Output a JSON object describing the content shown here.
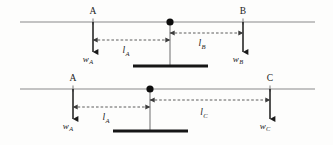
{
  "figure": {
    "name": "lever-moment-diagram",
    "background_color": "#fdfdfc",
    "line_color": "#8a8a8a",
    "arrow_color": "#1a1a1a",
    "dimension_color": "#4a4a4a",
    "support_color": "#161616"
  },
  "diagrams": [
    {
      "id": "top",
      "beam_y": 22,
      "beam_x1": 20,
      "beam_x2": 315,
      "pivot_x": 170,
      "support_bar": {
        "x1": 133,
        "x2": 208,
        "y": 66,
        "thickness": 3
      },
      "points": [
        {
          "id": "A",
          "label": "A",
          "x": 93,
          "label_y": 14,
          "force_label": "w",
          "force_sub": "A",
          "force_x": 88,
          "force_y": 62,
          "arrow_y_end": 52
        },
        {
          "id": "B",
          "label": "B",
          "x": 243,
          "label_y": 14,
          "force_label": "w",
          "force_sub": "B",
          "force_x": 238,
          "force_y": 62,
          "arrow_y_end": 52
        }
      ],
      "dimensions": [
        {
          "id": "lA",
          "label": "l",
          "sub": "A",
          "from_x": 93,
          "to_x": 170,
          "y": 40,
          "text_x": 126,
          "text_y": 53
        },
        {
          "id": "lB",
          "label": "l",
          "sub": "B",
          "from_x": 170,
          "to_x": 243,
          "y": 33,
          "text_x": 202,
          "text_y": 46
        }
      ]
    },
    {
      "id": "bottom",
      "beam_y": 89,
      "beam_x1": 20,
      "beam_x2": 315,
      "pivot_x": 150,
      "support_bar": {
        "x1": 113,
        "x2": 188,
        "y": 131,
        "thickness": 3
      },
      "points": [
        {
          "id": "A",
          "label": "A",
          "x": 73,
          "label_y": 81,
          "force_label": "w",
          "force_sub": "A",
          "force_x": 68,
          "force_y": 129,
          "arrow_y_end": 119
        },
        {
          "id": "C",
          "label": "C",
          "x": 270,
          "label_y": 81,
          "force_label": "w",
          "force_sub": "C",
          "force_x": 265,
          "force_y": 129,
          "arrow_y_end": 119
        }
      ],
      "dimensions": [
        {
          "id": "lA",
          "label": "l",
          "sub": "A",
          "from_x": 73,
          "to_x": 150,
          "y": 107,
          "text_x": 106,
          "text_y": 120
        },
        {
          "id": "lC",
          "label": "l",
          "sub": "C",
          "from_x": 150,
          "to_x": 270,
          "y": 100,
          "text_x": 204,
          "text_y": 115
        }
      ]
    }
  ],
  "legend_text": {
    "point_a": "A",
    "point_b": "B",
    "point_c": "C",
    "force_a": "wA",
    "force_b": "wB",
    "force_c": "wC",
    "length_a": "lA",
    "length_b": "lB",
    "length_c": "lC"
  }
}
